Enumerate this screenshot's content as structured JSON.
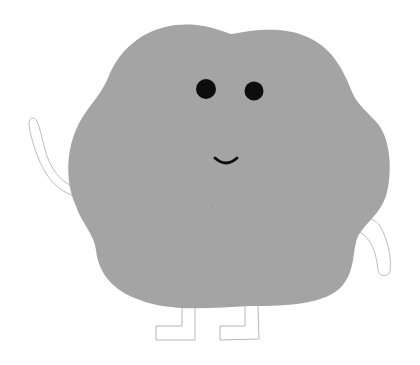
{
  "illustration": {
    "subject": "gray blob character waving",
    "colors": {
      "background": "#ffffff",
      "body": "#a4a4a4",
      "features": "#0d0d0d",
      "limb_outline": "#bdbdbd",
      "limb_fill": "#ffffff"
    },
    "parts": [
      "body",
      "left-eye",
      "right-eye",
      "mouth",
      "left-arm",
      "right-arm",
      "left-leg",
      "right-leg"
    ]
  }
}
